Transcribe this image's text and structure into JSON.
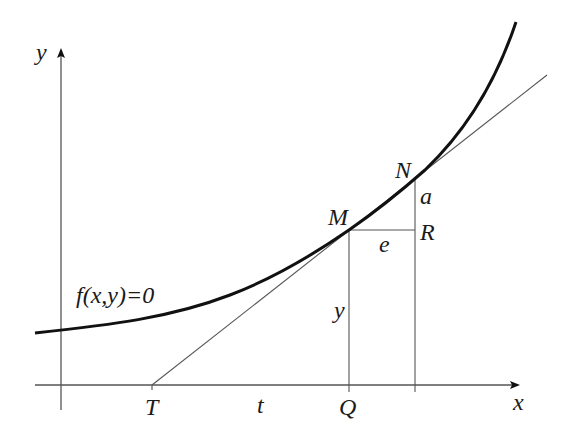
{
  "figure": {
    "type": "tangent-line-construction"
  },
  "colors": {
    "background": "#ffffff",
    "curve": "#111111",
    "lines": "#555555",
    "text": "#1a1a1a"
  },
  "axes": {
    "x_label": "x",
    "y_label": "y"
  },
  "curve": {
    "label": "f(x,y)=0"
  },
  "points": {
    "M": "M",
    "N": "N",
    "R": "R",
    "T": "T",
    "Q": "Q"
  },
  "segments": {
    "a": "a",
    "e": "e",
    "y": "y",
    "t": "t"
  }
}
